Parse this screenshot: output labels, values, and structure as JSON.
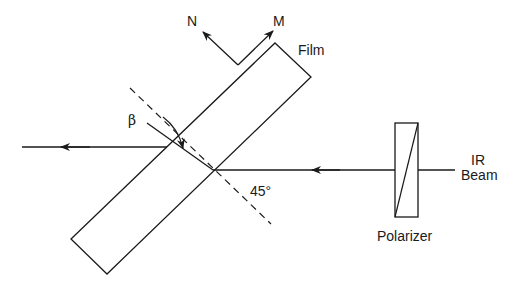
{
  "diagram": {
    "labels": {
      "n": "N",
      "m": "M",
      "film": "Film",
      "beta": "β",
      "angle": "45°",
      "ir": "IR",
      "beam": "Beam",
      "polarizer": "Polarizer"
    },
    "colors": {
      "line": "#1a1a1a",
      "background": "#ffffff"
    },
    "components": [
      {
        "name": "film",
        "shape": "rotated-rectangle"
      },
      {
        "name": "polarizer",
        "shape": "rectangle-with-diagonal"
      },
      {
        "name": "incident-beam",
        "direction": "right-to-left"
      },
      {
        "name": "exit-beam",
        "direction": "right-to-left"
      },
      {
        "name": "surface-normal",
        "style": "dashed"
      },
      {
        "name": "axis-N",
        "style": "arrow"
      },
      {
        "name": "axis-M",
        "style": "arrow"
      }
    ]
  }
}
